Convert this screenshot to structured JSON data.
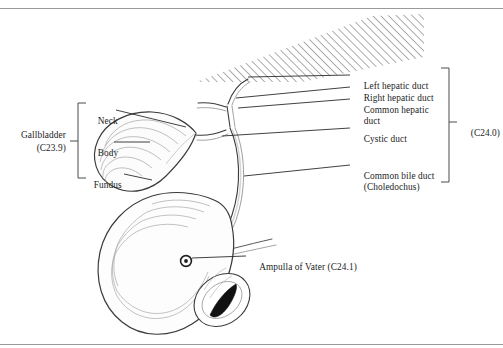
{
  "figure": {
    "frame": {
      "top_rule_y": 8,
      "bottom_rule_y": 344,
      "rule_color": "#9a9a9a"
    },
    "ink_color": "#2b2b2b",
    "text_color": "#1c1c1c",
    "liver": {
      "name": "liver-hatched-region",
      "hatch_angle_deg": 45,
      "hatch_spacing_px": 4,
      "hatch_color": "#6e6e6e"
    }
  },
  "left_group": {
    "group_label": "Gallbladder",
    "group_code": "(C23.9)",
    "bracket": {
      "x": 78,
      "y_top": 103,
      "y_bottom": 178,
      "tick_y": 141
    },
    "parts": [
      {
        "label": "Neck",
        "y": 110,
        "leader_from_x": 115,
        "leader_to_x": 152
      },
      {
        "label": "Body",
        "y": 142,
        "leader_from_x": 115,
        "leader_to_x": 148
      },
      {
        "label": "Fundus",
        "y": 174,
        "leader_from_x": 122,
        "leader_to_x": 152
      }
    ]
  },
  "right_group": {
    "group_code": "(C24.0)",
    "bracket": {
      "x": 449,
      "y_top": 68,
      "y_bottom": 182,
      "tick_y": 122
    },
    "items": [
      {
        "label": "Left hepatic duct",
        "y": 75,
        "leader_from_x": 302,
        "leader_to_x": 350
      },
      {
        "label": "Right hepatic duct",
        "y": 87,
        "leader_from_x": 302,
        "leader_to_x": 350
      },
      {
        "label": "Common hepatic",
        "label2": "duct",
        "y": 99,
        "leader_from_x": 302,
        "leader_to_x": 350
      },
      {
        "label": "Cystic duct",
        "y": 128,
        "leader_from_x": 302,
        "leader_to_x": 350
      },
      {
        "label": "Common bile duct",
        "label2": "(Choledochus)",
        "y": 165,
        "leader_from_x": 302,
        "leader_to_x": 350
      }
    ]
  },
  "callout": {
    "label": "Ampulla of Vater (C24.1)",
    "marker": {
      "name": "ampulla-marker",
      "cx": 186,
      "cy": 261,
      "r": 5
    },
    "leader_from_x": 196,
    "leader_to_x": 246,
    "leader_y": 256,
    "text_x": 250,
    "text_y": 250
  }
}
